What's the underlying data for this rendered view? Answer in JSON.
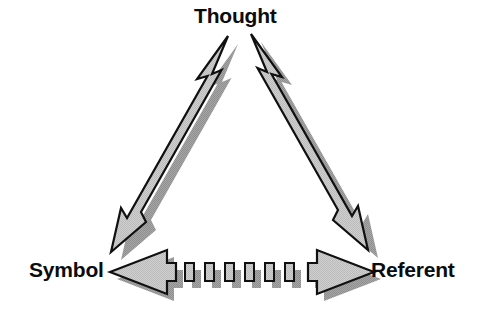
{
  "figure": {
    "background_color": "#ffffff",
    "nodes": [
      {
        "id": "thought",
        "label": "Thought",
        "position": "top"
      },
      {
        "id": "symbol",
        "label": "Symbol",
        "position": "bottom-left"
      },
      {
        "id": "referent",
        "label": "Referent",
        "position": "bottom-right"
      }
    ],
    "connectors": [
      {
        "id": "symbol-thought",
        "from": "Symbol",
        "to": "Thought",
        "style": "solid",
        "heads": "double",
        "orientation": "diagonal-up-right"
      },
      {
        "id": "thought-referent",
        "from": "Thought",
        "to": "Referent",
        "style": "solid",
        "heads": "double",
        "orientation": "diagonal-down-right"
      },
      {
        "id": "symbol-referent",
        "from": "Symbol",
        "to": "Referent",
        "style": "dashed",
        "heads": "double",
        "orientation": "horizontal",
        "dash_segments": 6
      }
    ],
    "colors": {
      "arrow_fill": "#c9c9c9",
      "arrow_outline": "#101010",
      "arrow_shadow": "#9a9a9a",
      "label_text": "#0c0c0c",
      "background": "#ffffff"
    }
  }
}
